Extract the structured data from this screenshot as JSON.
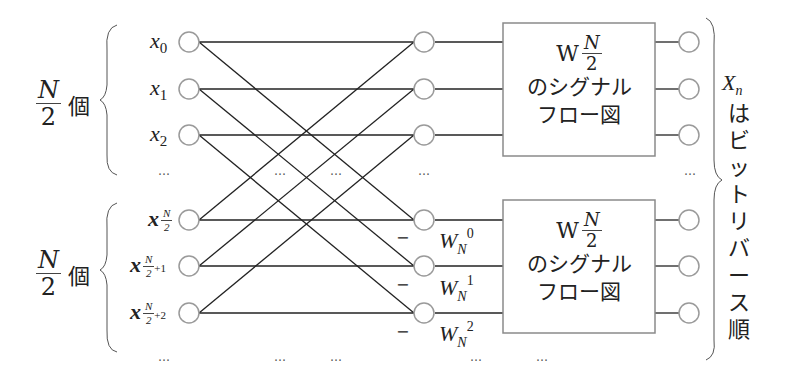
{
  "left_groups": [
    {
      "count_num": "N",
      "count_den": "2",
      "count_suffix": "個"
    },
    {
      "count_num": "N",
      "count_den": "2",
      "count_suffix": "個"
    }
  ],
  "inputs": [
    {
      "base": "x",
      "sub": "0"
    },
    {
      "base": "x",
      "sub": "1"
    },
    {
      "base": "x",
      "sub": "2"
    },
    {
      "base": "x",
      "sub_frac_num": "N",
      "sub_frac_den": "2",
      "sub_extra": ""
    },
    {
      "base": "x",
      "sub_frac_num": "N",
      "sub_frac_den": "2",
      "sub_extra": "+1"
    },
    {
      "base": "x",
      "sub_frac_num": "N",
      "sub_frac_den": "2",
      "sub_extra": "+2"
    }
  ],
  "ellipsis": "…",
  "minus_sign": "−",
  "twiddles": [
    {
      "base": "W",
      "sub": "N",
      "sup": "0"
    },
    {
      "base": "W",
      "sub": "N",
      "sup": "1"
    },
    {
      "base": "W",
      "sub": "N",
      "sup": "2"
    }
  ],
  "blocks": [
    {
      "w": "W",
      "frac_num": "N",
      "frac_den": "2",
      "line1": "のシグナル",
      "line2": "フロー図"
    },
    {
      "w": "W",
      "frac_num": "N",
      "frac_den": "2",
      "line1": "のシグナル",
      "line2": "フロー図"
    }
  ],
  "output_label": {
    "base": "X",
    "sub": "n",
    "chars": [
      "は",
      "ビ",
      "ッ",
      "ト",
      "リ",
      "バ",
      "ー",
      "ス",
      "順"
    ]
  },
  "colors": {
    "line": "#222222",
    "node": "#9a9a9a",
    "box": "#8a8a8a"
  }
}
